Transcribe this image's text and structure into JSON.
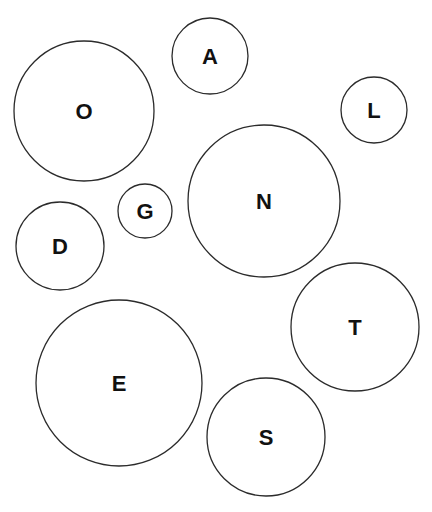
{
  "diagram": {
    "type": "letter-bubbles",
    "background": "#ffffff",
    "stroke_color": "#2b2b2b",
    "text_color": "#111111",
    "bubbles": [
      {
        "letter": "O",
        "cx": 84,
        "cy": 111,
        "r": 70
      },
      {
        "letter": "A",
        "cx": 210,
        "cy": 56,
        "r": 38
      },
      {
        "letter": "L",
        "cx": 374,
        "cy": 110,
        "r": 33
      },
      {
        "letter": "G",
        "cx": 145,
        "cy": 211,
        "r": 27
      },
      {
        "letter": "N",
        "cx": 264,
        "cy": 201,
        "r": 76
      },
      {
        "letter": "D",
        "cx": 60,
        "cy": 246,
        "r": 44
      },
      {
        "letter": "T",
        "cx": 355,
        "cy": 327,
        "r": 64
      },
      {
        "letter": "E",
        "cx": 119,
        "cy": 383,
        "r": 83
      },
      {
        "letter": "S",
        "cx": 266,
        "cy": 437,
        "r": 59
      }
    ]
  }
}
